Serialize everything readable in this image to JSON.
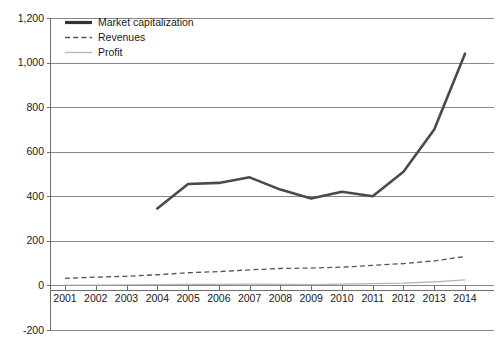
{
  "chart_data": {
    "type": "line",
    "title": "",
    "xlabel": "",
    "ylabel": "",
    "grid": true,
    "legend_position": "top-left",
    "x": [
      2001,
      2002,
      2003,
      2004,
      2005,
      2006,
      2007,
      2008,
      2009,
      2010,
      2011,
      2012,
      2013,
      2014
    ],
    "xtick_labels": [
      "2001",
      "2002",
      "2003",
      "2004",
      "2005",
      "2006",
      "2007",
      "2008",
      "2009",
      "2010",
      "2011",
      "2012",
      "2013",
      "2014"
    ],
    "ytick_labels": [
      "1,200",
      "1,000",
      "800",
      "600",
      "400",
      "200",
      "0",
      "-200"
    ],
    "ytick_values": [
      1200,
      1000,
      800,
      600,
      400,
      200,
      0,
      -200
    ],
    "ylim": [
      -200,
      1200
    ],
    "xlim": [
      2001,
      2014
    ],
    "series": [
      {
        "name": "Market capitalization",
        "style": "solid-thick",
        "color": "#4a4a4a",
        "x": [
          2004,
          2005,
          2006,
          2007,
          2008,
          2009,
          2010,
          2011,
          2012,
          2013,
          2014
        ],
        "values": [
          345,
          455,
          460,
          485,
          430,
          390,
          420,
          400,
          510,
          700,
          1040
        ]
      },
      {
        "name": "Revenues",
        "style": "dashed",
        "color": "#555555",
        "x": [
          2001,
          2002,
          2003,
          2004,
          2005,
          2006,
          2007,
          2008,
          2009,
          2010,
          2011,
          2012,
          2013,
          2014
        ],
        "values": [
          32,
          37,
          41,
          48,
          57,
          62,
          70,
          76,
          78,
          82,
          90,
          98,
          110,
          130
        ]
      },
      {
        "name": "Profit",
        "style": "solid-thin",
        "color": "#b4b4b4",
        "x": [
          2001,
          2002,
          2003,
          2004,
          2005,
          2006,
          2007,
          2008,
          2009,
          2010,
          2011,
          2012,
          2013,
          2014
        ],
        "values": [
          2,
          2,
          3,
          4,
          5,
          5,
          6,
          5,
          4,
          6,
          8,
          10,
          16,
          25
        ]
      }
    ],
    "legend": [
      "Market capitalization",
      "Revenues",
      "Profit"
    ]
  }
}
